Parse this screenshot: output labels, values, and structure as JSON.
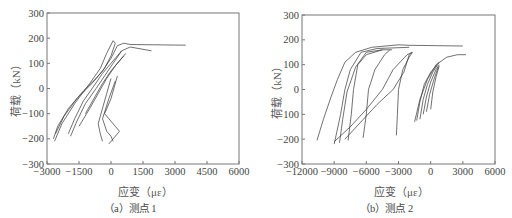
{
  "chart_data": [
    {
      "id": "a",
      "type": "line",
      "caption": "（a）测点 1",
      "xlabel": "应变（με）",
      "ylabel": "荷载（kN）",
      "xlim": [
        -3000,
        6000
      ],
      "ylim": [
        -300,
        300
      ],
      "xticks": [
        -3000,
        -1500,
        0,
        1500,
        3000,
        4500,
        6000
      ],
      "yticks": [
        -300,
        -200,
        -100,
        0,
        100,
        200,
        300
      ],
      "xtick_labels": [
        "−3000",
        "−1500",
        "0",
        "1500",
        "3000",
        "4500",
        "6000"
      ],
      "ytick_labels": [
        "−300",
        "−200",
        "−100",
        "0",
        "100",
        "200",
        "300"
      ],
      "grid": false,
      "legend": null,
      "series": [
        {
          "name": "loop-1",
          "points": [
            [
              -2700,
              -200
            ],
            [
              -2500,
              -150
            ],
            [
              -2000,
              -80
            ],
            [
              -1300,
              -10
            ],
            [
              -700,
              40
            ],
            [
              -300,
              80
            ],
            [
              0,
              130
            ],
            [
              200,
              180
            ],
            [
              100,
              190
            ],
            [
              -200,
              140
            ],
            [
              -500,
              80
            ],
            [
              -1000,
              20
            ],
            [
              -1700,
              -60
            ],
            [
              -2300,
              -140
            ],
            [
              -2650,
              -210
            ]
          ]
        },
        {
          "name": "loop-2",
          "points": [
            [
              -2600,
              -180
            ],
            [
              -2200,
              -110
            ],
            [
              -1600,
              -40
            ],
            [
              -900,
              20
            ],
            [
              -400,
              70
            ],
            [
              0,
              120
            ],
            [
              300,
              170
            ],
            [
              600,
              180
            ],
            [
              900,
              175
            ],
            [
              3500,
              172
            ]
          ]
        },
        {
          "name": "loop-3",
          "points": [
            [
              -1900,
              -190
            ],
            [
              -1600,
              -130
            ],
            [
              -1200,
              -60
            ],
            [
              -700,
              0
            ],
            [
              -300,
              50
            ],
            [
              100,
              100
            ],
            [
              500,
              150
            ],
            [
              900,
              165
            ],
            [
              1900,
              150
            ]
          ]
        },
        {
          "name": "loop-4",
          "points": [
            [
              -2000,
              -180
            ],
            [
              -1700,
              -120
            ],
            [
              -1300,
              -50
            ],
            [
              -800,
              10
            ],
            [
              -400,
              60
            ],
            [
              0,
              100
            ],
            [
              300,
              130
            ],
            [
              500,
              150
            ]
          ]
        },
        {
          "name": "loop-5",
          "points": [
            [
              -1500,
              -150
            ],
            [
              -1000,
              -80
            ],
            [
              -600,
              -20
            ],
            [
              -200,
              40
            ],
            [
              200,
              90
            ],
            [
              600,
              130
            ]
          ]
        },
        {
          "name": "loop-6",
          "points": [
            [
              -1200,
              -100
            ],
            [
              -800,
              -40
            ],
            [
              -400,
              20
            ],
            [
              0,
              70
            ],
            [
              400,
              110
            ],
            [
              700,
              140
            ]
          ]
        },
        {
          "name": "branch-down-1",
          "points": [
            [
              0,
              40
            ],
            [
              -200,
              -20
            ],
            [
              -500,
              -110
            ],
            [
              -600,
              -140
            ],
            [
              -500,
              -180
            ],
            [
              -400,
              -210
            ]
          ]
        },
        {
          "name": "branch-down-2",
          "points": [
            [
              200,
              30
            ],
            [
              -100,
              -40
            ],
            [
              -400,
              -120
            ],
            [
              -200,
              -170
            ],
            [
              0,
              -190
            ],
            [
              100,
              -210
            ]
          ]
        },
        {
          "name": "branch-down-3",
          "points": [
            [
              300,
              50
            ],
            [
              0,
              -40
            ],
            [
              -300,
              -100
            ],
            [
              200,
              -150
            ],
            [
              400,
              -170
            ],
            [
              -100,
              -220
            ]
          ]
        }
      ]
    },
    {
      "id": "b",
      "type": "line",
      "caption": "（b）测点 2",
      "xlabel": "应变（με）",
      "ylabel": "荷载（kN）",
      "xlim": [
        -12000,
        6000
      ],
      "ylim": [
        -300,
        300
      ],
      "xticks": [
        -12000,
        -9000,
        -6000,
        -3000,
        0,
        3000,
        6000
      ],
      "yticks": [
        -300,
        -200,
        -100,
        0,
        100,
        200,
        300
      ],
      "xtick_labels": [
        "−12000",
        "−9000",
        "−6000",
        "−3000",
        "0",
        "3000",
        "6000"
      ],
      "ytick_labels": [
        "−300",
        "−200",
        "−100",
        "0",
        "100",
        "200",
        "300"
      ],
      "grid": false,
      "legend": null,
      "series": [
        {
          "name": "loop-1",
          "points": [
            [
              -10600,
              -205
            ],
            [
              -10000,
              -120
            ],
            [
              -9300,
              -30
            ],
            [
              -8700,
              40
            ],
            [
              -8000,
              110
            ],
            [
              -7000,
              150
            ],
            [
              -5500,
              170
            ],
            [
              -3000,
              180
            ],
            [
              -2000,
              178
            ],
            [
              3000,
              175
            ]
          ]
        },
        {
          "name": "loop-2",
          "points": [
            [
              -9000,
              -220
            ],
            [
              -8400,
              -100
            ],
            [
              -8000,
              0
            ],
            [
              -7500,
              80
            ],
            [
              -6500,
              150
            ],
            [
              -5000,
              165
            ],
            [
              -2000,
              170
            ]
          ]
        },
        {
          "name": "loop-3",
          "points": [
            [
              -8500,
              -215
            ],
            [
              -8200,
              -120
            ],
            [
              -7800,
              -10
            ],
            [
              -7000,
              90
            ],
            [
              -6000,
              150
            ],
            [
              -4500,
              160
            ],
            [
              -3600,
              160
            ]
          ]
        },
        {
          "name": "loop-4",
          "points": [
            [
              -7700,
              -205
            ],
            [
              -7400,
              -100
            ],
            [
              -7200,
              0
            ],
            [
              -6800,
              100
            ],
            [
              -6000,
              140
            ],
            [
              -4500,
              160
            ]
          ]
        },
        {
          "name": "loop-5",
          "points": [
            [
              -6300,
              -195
            ],
            [
              -6000,
              -100
            ],
            [
              -5800,
              0
            ],
            [
              -5200,
              80
            ],
            [
              -4300,
              140
            ],
            [
              -3800,
              160
            ]
          ]
        },
        {
          "name": "loop-6",
          "points": [
            [
              -9000,
              -210
            ],
            [
              -7500,
              -150
            ],
            [
              -6000,
              -80
            ],
            [
              -4500,
              0
            ],
            [
              -3500,
              80
            ],
            [
              -2200,
              140
            ],
            [
              -1700,
              150
            ]
          ]
        },
        {
          "name": "loop-7",
          "points": [
            [
              -3200,
              -185
            ],
            [
              -3100,
              -100
            ],
            [
              -3000,
              0
            ],
            [
              -2600,
              80
            ],
            [
              -2000,
              130
            ],
            [
              -1700,
              150
            ]
          ]
        },
        {
          "name": "loop-8",
          "points": [
            [
              -8000,
              -200
            ],
            [
              -6500,
              -130
            ],
            [
              -5000,
              -60
            ],
            [
              -3500,
              0
            ],
            [
              -2500,
              70
            ],
            [
              -2000,
              140
            ],
            [
              -1800,
              150
            ]
          ]
        },
        {
          "name": "loop-9",
          "points": [
            [
              -1500,
              -130
            ],
            [
              -1000,
              -40
            ],
            [
              -300,
              40
            ],
            [
              500,
              100
            ],
            [
              1500,
              130
            ],
            [
              2500,
              140
            ],
            [
              3300,
              140
            ]
          ]
        },
        {
          "name": "loop-10",
          "points": [
            [
              -1300,
              -125
            ],
            [
              -1000,
              -50
            ],
            [
              -600,
              20
            ],
            [
              0,
              70
            ],
            [
              600,
              100
            ]
          ]
        },
        {
          "name": "loop-11",
          "points": [
            [
              -1000,
              -120
            ],
            [
              -700,
              -40
            ],
            [
              -300,
              20
            ],
            [
              200,
              70
            ],
            [
              800,
              110
            ]
          ]
        },
        {
          "name": "loop-12",
          "points": [
            [
              -700,
              -100
            ],
            [
              -400,
              -30
            ],
            [
              0,
              30
            ],
            [
              500,
              80
            ],
            [
              800,
              100
            ]
          ]
        },
        {
          "name": "loop-13",
          "points": [
            [
              -400,
              -90
            ],
            [
              -100,
              -20
            ],
            [
              300,
              40
            ],
            [
              700,
              90
            ]
          ]
        },
        {
          "name": "loop-14",
          "points": [
            [
              0,
              -80
            ],
            [
              200,
              -10
            ],
            [
              500,
              50
            ],
            [
              800,
              95
            ]
          ]
        }
      ]
    }
  ]
}
